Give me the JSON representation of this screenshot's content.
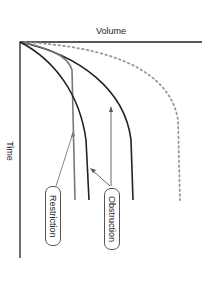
{
  "diagram": {
    "type": "flow-volume time curves",
    "x_axis_label": "Volume",
    "y_axis_label": "Time",
    "curves": [
      {
        "name": "normal",
        "style": "dotted",
        "color": "#999999"
      },
      {
        "name": "obstruction-mild",
        "style": "solid",
        "color": "#222222"
      },
      {
        "name": "obstruction-severe",
        "style": "solid",
        "color": "#222222"
      },
      {
        "name": "restriction",
        "style": "solid",
        "color": "#777777"
      },
      {
        "name": "restriction-inner",
        "style": "solid",
        "color": "#222222"
      }
    ],
    "labels": {
      "restriction": "Restriction",
      "obstruction": "Obstruction"
    }
  }
}
